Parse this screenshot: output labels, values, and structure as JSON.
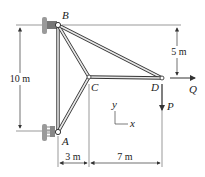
{
  "diagram": {
    "joints": [
      {
        "id": "A",
        "label": "A"
      },
      {
        "id": "B",
        "label": "B"
      },
      {
        "id": "C",
        "label": "C"
      },
      {
        "id": "D",
        "label": "D"
      }
    ],
    "members": [
      "AB",
      "BC",
      "AC",
      "BD",
      "CD"
    ],
    "loads": [
      {
        "id": "P",
        "label": "P",
        "direction": "down",
        "at": "D"
      },
      {
        "id": "Q",
        "label": "Q",
        "direction": "right",
        "at": "D"
      }
    ],
    "dimensions": {
      "AB_height": "10 m",
      "B_to_D_vertical": "5 m",
      "A_to_C_horizontal": "3 m",
      "C_to_D_horizontal": "7 m"
    },
    "axes": {
      "x": "x",
      "y": "y"
    },
    "colors": {
      "line": "#333333",
      "member_fill": "#e8e8e8",
      "support": "#9a9a9a"
    }
  }
}
